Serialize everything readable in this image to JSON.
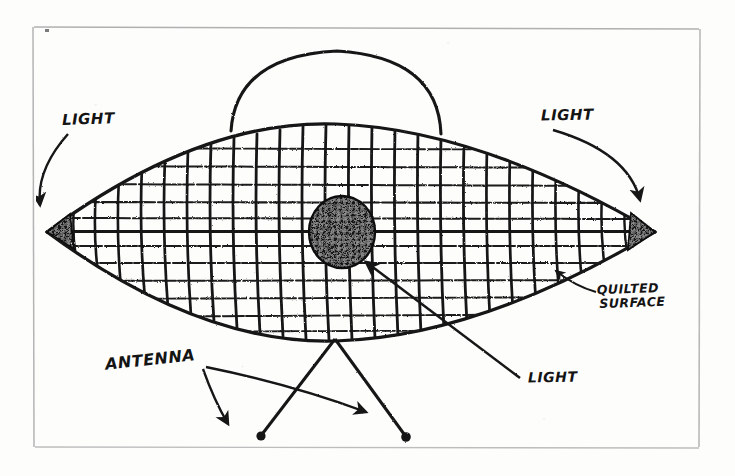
{
  "drawing": {
    "title": "Hand-drawn UFO / flying saucer witness sketch",
    "medium": "ink on paper, photocopied",
    "ink_color": "#121212",
    "paper_color": "#fdfdfc",
    "frame_color": "#b8b8b8"
  },
  "labels": {
    "light_left": "LIGHT",
    "light_right": "LIGHT",
    "light_center": "LIGHT",
    "antenna": "ANTENNA",
    "quilted_line1": "QUILTED",
    "quilted_line2": "SURFACE"
  },
  "parts": {
    "dome": "dome",
    "hull": "lens-shaped-hull",
    "grid": "quilted-grid",
    "center_light": "central-dark-dome-light",
    "left_light": "left-tip-light",
    "right_light": "right-tip-light",
    "antenna_left": "antenna-left",
    "antenna_right": "antenna-right"
  },
  "geometry": {
    "frame": {
      "x": 33,
      "y": 26,
      "w": 667,
      "h": 422
    },
    "hull": {
      "left_x": 47,
      "right_x": 655,
      "center_y": 232,
      "half_height": 108
    },
    "dome": {
      "center_x": 336,
      "base_y": 128,
      "radius": 105
    },
    "center_light": {
      "cx": 342,
      "cy": 232,
      "rx": 33,
      "ry": 36
    },
    "antenna_apex": {
      "x": 335,
      "y": 339
    },
    "antenna_left_tip": {
      "x": 262,
      "y": 436
    },
    "antenna_right_tip": {
      "x": 405,
      "y": 438
    },
    "grid_vertical_ribs": 26,
    "grid_horizontal_lines": 11
  }
}
